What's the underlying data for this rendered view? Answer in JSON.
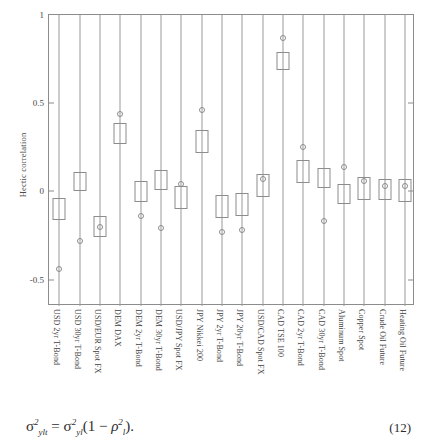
{
  "chart_data": {
    "type": "boxplot",
    "title": "",
    "xlabel": "",
    "ylabel": "Hectic correlation",
    "ylim": [
      -0.65,
      1.0
    ],
    "yticks": [
      1,
      0.5,
      0,
      -0.5
    ],
    "ytick_labels": [
      "1",
      "0.5",
      "0",
      "-0.5"
    ],
    "grid": false,
    "legend": "none",
    "orientation": "vertical",
    "categories": [
      "USD 2yr T-Bond",
      "USD 30yr T-Bond",
      "USD/EUR Spot FX",
      "DEM DAX",
      "DEM 2yr T-Bond",
      "DEM 30yr T-Bond",
      "USD/JPY Spot FX",
      "JPY Nikkei 200",
      "JPY 2yr T-Bond",
      "JPY 20yr T-Bond",
      "USD/CAD Spot FX",
      "CAD TSE 100",
      "CAD 2yr T-Bond",
      "CAD 30yr T-Bond",
      "Aluminum Spot",
      "Copper Spot",
      "Crude Oil Future",
      "Heating Oil Future"
    ],
    "boxes": [
      {
        "label": "USD 2yr T-Bond",
        "whisker_low": -0.65,
        "q1": -0.16,
        "q3": -0.04,
        "whisker_high": 1.0,
        "marker": -0.44
      },
      {
        "label": "USD 30yr T-Bond",
        "whisker_low": -0.65,
        "q1": 0.0,
        "q3": 0.11,
        "whisker_high": 1.0,
        "marker": -0.28
      },
      {
        "label": "USD/EUR Spot FX",
        "whisker_low": -0.65,
        "q1": -0.26,
        "q3": -0.14,
        "whisker_high": 1.0,
        "marker": -0.2
      },
      {
        "label": "DEM DAX",
        "whisker_low": -0.65,
        "q1": 0.27,
        "q3": 0.39,
        "whisker_high": 1.0,
        "marker": 0.44
      },
      {
        "label": "DEM 2yr T-Bond",
        "whisker_low": -0.65,
        "q1": -0.06,
        "q3": 0.06,
        "whisker_high": 1.0,
        "marker": -0.14
      },
      {
        "label": "DEM 30yr T-Bond",
        "whisker_low": -0.65,
        "q1": 0.01,
        "q3": 0.12,
        "whisker_high": 1.0,
        "marker": -0.21
      },
      {
        "label": "USD/JPY Spot FX",
        "whisker_low": -0.65,
        "q1": -0.1,
        "q3": 0.03,
        "whisker_high": 1.0,
        "marker": 0.04
      },
      {
        "label": "JPY Nikkei 200",
        "whisker_low": -0.65,
        "q1": 0.22,
        "q3": 0.35,
        "whisker_high": 1.0,
        "marker": 0.46
      },
      {
        "label": "JPY 2yr T-Bond",
        "whisker_low": -0.65,
        "q1": -0.15,
        "q3": -0.02,
        "whisker_high": 1.0,
        "marker": -0.23
      },
      {
        "label": "JPY 20yr T-Bond",
        "whisker_low": -0.65,
        "q1": -0.14,
        "q3": -0.01,
        "whisker_high": 1.0,
        "marker": -0.22
      },
      {
        "label": "USD/CAD Spot FX",
        "whisker_low": -0.65,
        "q1": -0.03,
        "q3": 0.1,
        "whisker_high": 1.0,
        "marker": 0.07
      },
      {
        "label": "CAD TSE 100",
        "whisker_low": -0.65,
        "q1": 0.69,
        "q3": 0.79,
        "whisker_high": 1.0,
        "marker": 0.87
      },
      {
        "label": "CAD 2yr T-Bond",
        "whisker_low": -0.65,
        "q1": 0.05,
        "q3": 0.18,
        "whisker_high": 1.0,
        "marker": 0.25
      },
      {
        "label": "CAD 30yr T-Bond",
        "whisker_low": -0.65,
        "q1": 0.02,
        "q3": 0.13,
        "whisker_high": 1.0,
        "marker": -0.17
      },
      {
        "label": "Aluminum Spot",
        "whisker_low": -0.65,
        "q1": -0.07,
        "q3": 0.04,
        "whisker_high": 1.0,
        "marker": 0.14
      },
      {
        "label": "Copper Spot",
        "whisker_low": -0.65,
        "q1": -0.05,
        "q3": 0.08,
        "whisker_high": 1.0,
        "marker": 0.06
      },
      {
        "label": "Crude Oil Future",
        "whisker_low": -0.65,
        "q1": -0.05,
        "q3": 0.07,
        "whisker_high": 1.0,
        "marker": 0.03
      },
      {
        "label": "Heating Oil Future",
        "whisker_low": -0.65,
        "q1": -0.06,
        "q3": 0.07,
        "whisker_high": 1.0,
        "marker": 0.03
      }
    ]
  },
  "equation": {
    "text": "σ²ylt = σ²yl(1 − ρ²l)",
    "lhs_symbol": "σ",
    "number": "(12)"
  }
}
